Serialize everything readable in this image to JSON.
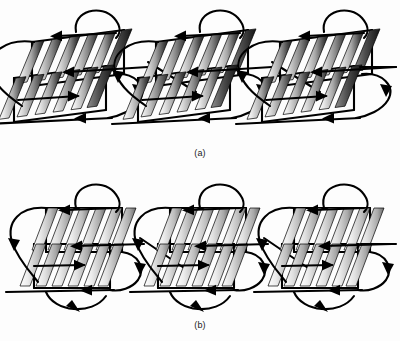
{
  "figure": {
    "title": "",
    "background_color": "#fdfdfd",
    "ink_color": "#000000",
    "panels": [
      {
        "id": "a",
        "caption": "(a)",
        "cell_count": 3,
        "description": "row of three unit cells with slanted gradient plates and wire loops",
        "plate_rows_per_cell": 2,
        "plates_per_row": 6,
        "plate_style": "dark-contrast",
        "gradient_light": "#f2f2f2",
        "gradient_mid": "#9a9a9a",
        "gradient_dark": "#2b2b2b"
      },
      {
        "id": "b",
        "caption": "(b)",
        "cell_count": 3,
        "description": "row of three unit cells with upright lighter gradient plates and wire loops",
        "plate_rows_per_cell": 2,
        "plates_per_row": 6,
        "plate_style": "light-contrast",
        "gradient_light": "#fafafa",
        "gradient_mid": "#b5b5b5",
        "gradient_dark": "#6e6e6e"
      }
    ],
    "annotations": {
      "arrow_direction_top": "left",
      "arrow_direction_bottom": "left",
      "arrow_direction_left_loop": "down",
      "arrow_direction_right_loop": "down",
      "connector": "diagonal descending left-to-right"
    }
  }
}
